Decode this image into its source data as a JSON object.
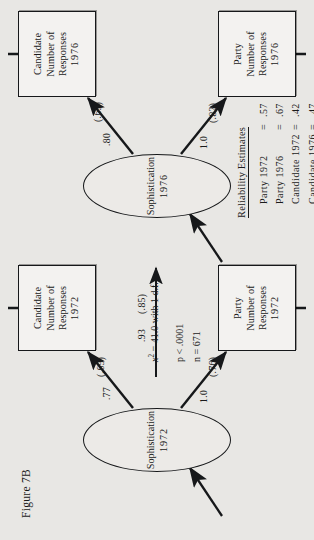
{
  "figure": {
    "label": "Figure 7B",
    "caption_id": "7B"
  },
  "nodes": {
    "latent": [
      {
        "id": "soph1976",
        "name": "Sophistication",
        "year": "1976"
      },
      {
        "id": "soph1972",
        "name": "Sophistication",
        "year": "1972"
      }
    ],
    "observed": [
      {
        "id": "cand1976",
        "line1": "Candidate",
        "line2": "Number of",
        "line3": "Responses",
        "year": "1976"
      },
      {
        "id": "party1976",
        "line1": "Party",
        "line2": "Number of",
        "line3": "Responses",
        "year": "1976"
      },
      {
        "id": "cand1972",
        "line1": "Candidate",
        "line2": "Number of",
        "line3": "Responses",
        "year": "1972"
      },
      {
        "id": "party1972",
        "line1": "Party",
        "line2": "Number of",
        "line3": "Responses",
        "year": "1972"
      }
    ]
  },
  "paths": [
    {
      "id": "soph72-to-soph76",
      "coefficient": ".93",
      "standardized": "(.85)"
    },
    {
      "id": "soph76-to-cand76",
      "coefficient": ".80",
      "standardized": "(.69)"
    },
    {
      "id": "soph76-to-party76",
      "coefficient": "1.0",
      "standardized": "(.82)"
    },
    {
      "id": "soph72-to-cand72",
      "coefficient": ".77",
      "standardized": "(.65)"
    },
    {
      "id": "soph72-to-party72",
      "coefficient": "1.0",
      "standardized": "(.76)"
    }
  ],
  "reliability": {
    "title": "Reliability Estimates",
    "rows": [
      {
        "label": "Party 1972",
        "eq": "=",
        "value": ".57"
      },
      {
        "label": "Party 1976",
        "eq": "=",
        "value": ".67"
      },
      {
        "label": "Candidate 1972",
        "eq": "=",
        "value": ".42"
      },
      {
        "label": "Candidate 1976",
        "eq": "=",
        "value": ".47"
      }
    ]
  },
  "fit_statistics": {
    "chisq_symbol": "x",
    "chisq_exponent": "2",
    "chisq_text": "= 41.0 with 1 d.f.",
    "p_label": "p",
    "p_text": "< .0001",
    "n_label": "n",
    "n_text": "= 671"
  }
}
